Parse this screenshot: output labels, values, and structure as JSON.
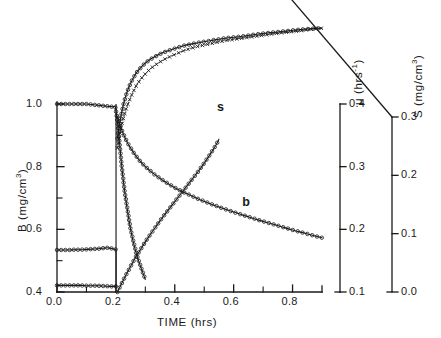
{
  "figure": {
    "background": "#ffffff",
    "ink": "#1a1a1a"
  },
  "axes": {
    "left": {
      "title": "B (mg/cm",
      "title_sup": "3",
      "title_tail": ")",
      "title_full": "B (mg/cm3)",
      "ticks": [
        "1.0",
        "0.8",
        "0.6",
        "0.4"
      ],
      "tick_values": [
        1.0,
        0.8,
        0.6,
        0.4
      ],
      "range": [
        0.4,
        1.0
      ]
    },
    "bottom": {
      "title": "TIME  (hrs)",
      "ticks": [
        "0.0",
        "0.2",
        "0.4",
        "0.6",
        "0.8"
      ],
      "tick_values": [
        0.0,
        0.2,
        0.4,
        0.6,
        0.8
      ],
      "range": [
        0.0,
        0.9
      ]
    },
    "right_mu": {
      "title": "μ  (hrs",
      "title_sup": "-1",
      "title_tail": ")",
      "title_full": "mu (hrs-1)",
      "ticks": [
        "0.4",
        "0.3",
        "0.2",
        "0.1"
      ],
      "tick_values": [
        0.4,
        0.3,
        0.2,
        0.1
      ],
      "range": [
        0.1,
        0.4
      ]
    },
    "right_s": {
      "title": "S  (mg/cm",
      "title_sup": "3",
      "title_tail": ")",
      "title_full": "S (mg/cm3)",
      "ticks": [
        "0.3",
        "0.2",
        "0.1",
        "0.0"
      ],
      "tick_values": [
        0.3,
        0.2,
        0.1,
        0.0
      ],
      "range": [
        0.0,
        0.3
      ]
    }
  },
  "annotations": [
    {
      "text": "s",
      "x": 0.543,
      "y_px": 108
    },
    {
      "text": "b",
      "x": 0.629,
      "y_px": 203
    }
  ],
  "chart_data": {
    "type": "line",
    "title": "",
    "xlabel": "TIME  (hrs)",
    "ylabel": "B (mg/cm3)",
    "y2label": "μ  (hrs-1)",
    "y3label": "S  (mg/cm3)",
    "xlim": [
      0.0,
      0.9
    ],
    "ylim": [
      0.4,
      1.0
    ],
    "y2lim": [
      0.1,
      0.4
    ],
    "y3lim": [
      0.0,
      0.3
    ],
    "grid": false,
    "legend": "none",
    "series": [
      {
        "name": "B plateau high",
        "axis": "left",
        "marker": "circle-open",
        "line": "solid",
        "x": [
          0.0,
          0.01,
          0.02,
          0.03,
          0.04,
          0.05,
          0.06,
          0.07,
          0.08,
          0.09,
          0.1,
          0.11,
          0.12,
          0.13,
          0.14,
          0.15,
          0.16,
          0.17,
          0.18,
          0.19,
          0.198,
          0.203,
          0.21,
          0.22,
          0.23,
          0.25,
          0.27,
          0.3
        ],
        "values": [
          1.0,
          1.0,
          1.0,
          1.0,
          1.0,
          1.0,
          1.0,
          1.0,
          1.0,
          1.0,
          1.0,
          0.999,
          0.998,
          0.997,
          0.996,
          0.995,
          0.994,
          0.993,
          0.992,
          0.991,
          0.99,
          0.96,
          0.9,
          0.8,
          0.72,
          0.6,
          0.52,
          0.44
        ]
      },
      {
        "name": "B plateau mid",
        "axis": "left",
        "marker": "circle-open",
        "line": "solid",
        "x": [
          0.0,
          0.02,
          0.04,
          0.06,
          0.08,
          0.1,
          0.12,
          0.14,
          0.16,
          0.17,
          0.18,
          0.19,
          0.198,
          0.2
        ],
        "values": [
          0.534,
          0.534,
          0.534,
          0.535,
          0.535,
          0.536,
          0.537,
          0.538,
          0.54,
          0.541,
          0.54,
          0.538,
          0.536,
          0.536
        ]
      },
      {
        "name": "B plateau low",
        "axis": "left",
        "marker": "circle-open",
        "line": "solid",
        "x": [
          0.0,
          0.02,
          0.04,
          0.06,
          0.08,
          0.1,
          0.12,
          0.14,
          0.16,
          0.18,
          0.19,
          0.2
        ],
        "values": [
          0.421,
          0.421,
          0.421,
          0.421,
          0.421,
          0.42,
          0.42,
          0.42,
          0.419,
          0.418,
          0.418,
          0.418
        ]
      },
      {
        "name": "mu upper (circles)",
        "axis": "right_mu",
        "marker": "circle-open",
        "line": "solid",
        "x": [
          0.205,
          0.215,
          0.225,
          0.235,
          0.245,
          0.255,
          0.27,
          0.29,
          0.31,
          0.33,
          0.36,
          0.39,
          0.43,
          0.47,
          0.52,
          0.57,
          0.63,
          0.69,
          0.75,
          0.81,
          0.86,
          0.9
        ],
        "values": [
          0.345,
          0.375,
          0.398,
          0.415,
          0.428,
          0.438,
          0.45,
          0.461,
          0.469,
          0.475,
          0.482,
          0.487,
          0.493,
          0.497,
          0.501,
          0.505,
          0.508,
          0.512,
          0.515,
          0.518,
          0.52,
          0.521
        ]
      },
      {
        "name": "mu lower (crosses)",
        "axis": "right_mu",
        "marker": "cross",
        "line": "dotted",
        "x": [
          0.205,
          0.215,
          0.225,
          0.235,
          0.245,
          0.255,
          0.27,
          0.29,
          0.31,
          0.33,
          0.36,
          0.39,
          0.43,
          0.47,
          0.52,
          0.57,
          0.63,
          0.69,
          0.75,
          0.81,
          0.86,
          0.9
        ],
        "values": [
          0.33,
          0.356,
          0.376,
          0.392,
          0.405,
          0.416,
          0.43,
          0.443,
          0.453,
          0.461,
          0.47,
          0.477,
          0.485,
          0.491,
          0.496,
          0.501,
          0.505,
          0.509,
          0.513,
          0.516,
          0.519,
          0.521
        ]
      },
      {
        "name": "b decay",
        "axis": "left",
        "marker": "circle-open",
        "line": "solid",
        "x": [
          0.205,
          0.215,
          0.225,
          0.24,
          0.26,
          0.28,
          0.3,
          0.33,
          0.36,
          0.4,
          0.44,
          0.48,
          0.52,
          0.56,
          0.6,
          0.64,
          0.68,
          0.72,
          0.76,
          0.8,
          0.84,
          0.88,
          0.9
        ],
        "values": [
          0.96,
          0.93,
          0.905,
          0.875,
          0.845,
          0.82,
          0.8,
          0.776,
          0.756,
          0.733,
          0.714,
          0.697,
          0.682,
          0.668,
          0.655,
          0.643,
          0.631,
          0.62,
          0.609,
          0.598,
          0.588,
          0.578,
          0.573
        ]
      },
      {
        "name": "s growth",
        "axis": "right_s",
        "marker": "circle-open",
        "line": "solid",
        "x": [
          0.205,
          0.215,
          0.225,
          0.235,
          0.25,
          0.265,
          0.28,
          0.3,
          0.32,
          0.34,
          0.36,
          0.38,
          0.4,
          0.42,
          0.44,
          0.46,
          0.48,
          0.5,
          0.52,
          0.54,
          0.55
        ],
        "values": [
          0.0,
          0.01,
          0.02,
          0.03,
          0.044,
          0.058,
          0.07,
          0.086,
          0.101,
          0.115,
          0.129,
          0.142,
          0.155,
          0.168,
          0.181,
          0.194,
          0.207,
          0.221,
          0.236,
          0.252,
          0.262
        ]
      }
    ]
  }
}
